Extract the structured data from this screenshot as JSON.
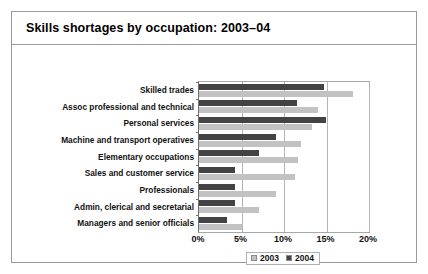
{
  "figure": {
    "title": "Skills shortages by occupation: 2003–04"
  },
  "chart_data": {
    "type": "bar",
    "orientation": "horizontal",
    "title": "Skills shortages by occupation: 2003–04",
    "xlabel": "",
    "ylabel": "",
    "xlim": [
      0,
      20
    ],
    "xticks": [
      0,
      5,
      10,
      15,
      20
    ],
    "xtick_labels": [
      "0%",
      "5%",
      "10%",
      "15%",
      "20%"
    ],
    "grid": true,
    "grid_axis": "x",
    "legend_position": "bottom-center",
    "categories": [
      "Skilled trades",
      "Assoc professional and technical",
      "Personal services",
      "Machine and transport operatives",
      "Elementary occupations",
      "Sales and customer service",
      "Professionals",
      "Admin, clerical and secretarial",
      "Managers and senior officials"
    ],
    "series": [
      {
        "name": "2003",
        "color": "#c2c2c2",
        "values": [
          18.1,
          14.0,
          13.3,
          12.0,
          11.6,
          11.3,
          9.1,
          7.0,
          5.0
        ]
      },
      {
        "name": "2004",
        "color": "#434343",
        "values": [
          14.7,
          11.5,
          14.9,
          9.0,
          7.1,
          4.2,
          4.2,
          4.2,
          3.3
        ]
      }
    ],
    "units": "percent"
  }
}
